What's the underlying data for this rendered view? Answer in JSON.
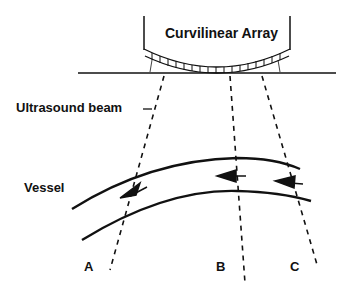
{
  "diagram": {
    "title": "Curvilinear Array",
    "labels": {
      "beam": "Ultrasound beam",
      "vessel": "Vessel"
    },
    "beams": [
      {
        "id": "A",
        "label": "A"
      },
      {
        "id": "B",
        "label": "B"
      },
      {
        "id": "C",
        "label": "C"
      }
    ],
    "colors": {
      "ink": "#111111",
      "background": "#ffffff"
    }
  }
}
